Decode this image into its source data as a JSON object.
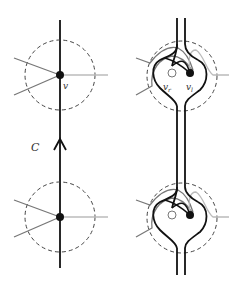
{
  "labels": {
    "curve": "C",
    "vertex": "v",
    "vertex_right": "v",
    "vertex_right_sub": "r",
    "vertex_left": "v",
    "vertex_left_sub": "l"
  },
  "colors": {
    "main_stroke": "#111111",
    "dark_edge": "#777777",
    "light_edge": "#bbbbbb",
    "dashed_circle": "#444444",
    "open_vertex_fill": "#ffffff"
  },
  "panels": [
    {
      "name": "left",
      "description": "curve C through vertices with dashed neighbourhood circles"
    },
    {
      "name": "right",
      "description": "doubled curve with heart-shaped loops around split vertices v_r and v_l"
    }
  ]
}
